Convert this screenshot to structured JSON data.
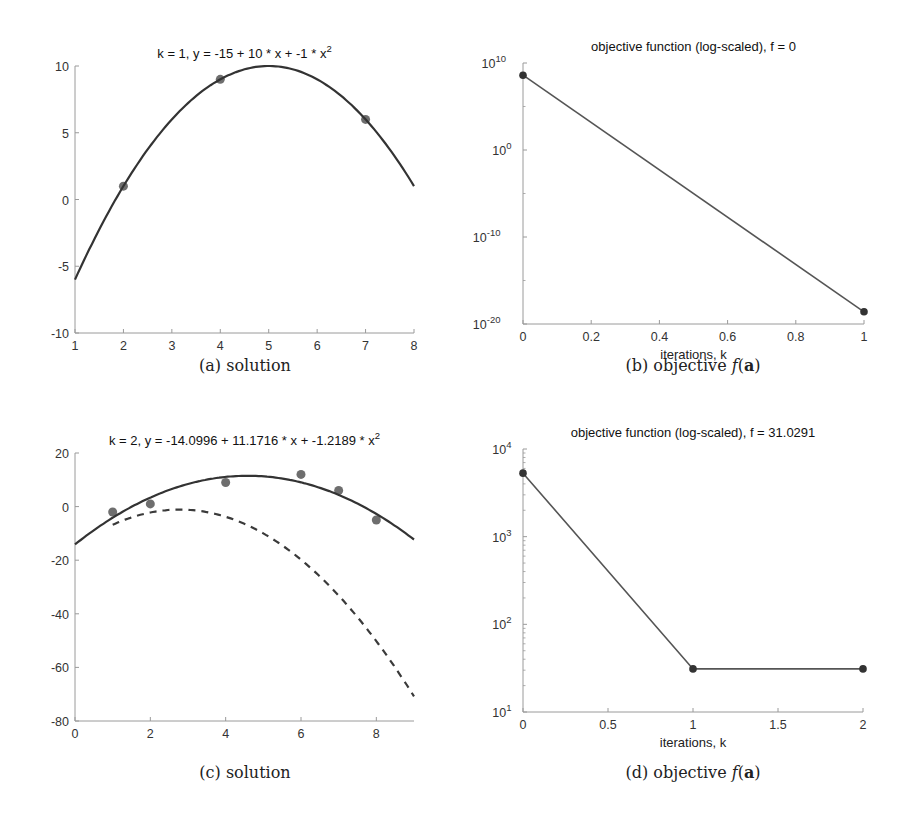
{
  "figure": {
    "captions": [
      {
        "label": "(a) solution"
      },
      {
        "label": "(b) objective",
        "math": "f",
        "arg": "a"
      },
      {
        "label": "(c) solution"
      },
      {
        "label": "(d) objective",
        "math": "f",
        "arg": "a"
      }
    ]
  },
  "chart_data": [
    {
      "id": "a",
      "type": "scatter",
      "title": "k = 1, y = -15 + 10 * x + -1 * x^2",
      "title_main": "k = 1, y = -15 + 10 * x + -1 * x",
      "title_sup": "2",
      "xlabel": "",
      "ylabel": "",
      "xlim": [
        1,
        8
      ],
      "ylim": [
        -10,
        10
      ],
      "xticks": [
        1,
        2,
        3,
        4,
        5,
        6,
        7,
        8
      ],
      "yticks": [
        -10,
        -5,
        0,
        5,
        10
      ],
      "series": [
        {
          "name": "data points",
          "style": "markers",
          "x": [
            2,
            4,
            7
          ],
          "y": [
            1,
            9,
            6
          ]
        },
        {
          "name": "fit",
          "style": "solid",
          "coeffs": [
            -15,
            10,
            -1
          ],
          "x_range": [
            1,
            8
          ]
        }
      ],
      "box": {
        "left": 75,
        "top": 66,
        "right": 414,
        "bottom": 333
      }
    },
    {
      "id": "b",
      "type": "line",
      "title": "objective function (log-scaled), f = 0",
      "xlabel": "iterations, k",
      "ylabel": "",
      "yscale": "log",
      "xlim": [
        0,
        1
      ],
      "ylim_exp": [
        -20,
        10
      ],
      "xticks": [
        0,
        0.2,
        0.4,
        0.6,
        0.8,
        1
      ],
      "xtick_labels": [
        "0",
        "0.2",
        "0.4",
        "0.6",
        "0.8",
        "1"
      ],
      "yticks_exp": [
        -20,
        -10,
        0,
        10
      ],
      "series": [
        {
          "name": "objective",
          "style": "line-markers",
          "x": [
            0,
            1
          ],
          "y_exp": [
            8.6,
            -18.6
          ]
        }
      ],
      "box": {
        "left": 523,
        "top": 63,
        "right": 864,
        "bottom": 324
      }
    },
    {
      "id": "c",
      "type": "scatter",
      "title": "k = 2, y = -14.0996 + 11.1716 * x + -1.2189 * x^2",
      "title_main": "k = 2, y = -14.0996 + 11.1716 * x + -1.2189 * x",
      "title_sup": "2",
      "xlabel": "",
      "ylabel": "",
      "xlim": [
        0,
        9
      ],
      "ylim": [
        -80,
        20
      ],
      "xticks": [
        0,
        2,
        4,
        6,
        8
      ],
      "yticks": [
        -80,
        -60,
        -40,
        -20,
        0,
        20
      ],
      "series": [
        {
          "name": "data points",
          "style": "markers",
          "x": [
            1,
            2,
            4,
            6,
            7,
            8
          ],
          "y": [
            -2,
            1,
            9,
            12,
            6,
            -5
          ]
        },
        {
          "name": "fit",
          "style": "solid",
          "coeffs": [
            -14.0996,
            11.1716,
            -1.2189
          ],
          "x_range": [
            0,
            9
          ]
        },
        {
          "name": "previous fit",
          "style": "dashed",
          "coeffs": [
            -15,
            10,
            -1.8
          ],
          "x_range": [
            1,
            9
          ]
        }
      ],
      "box": {
        "left": 75,
        "top": 453,
        "right": 414,
        "bottom": 721
      }
    },
    {
      "id": "d",
      "type": "line",
      "title": "objective function (log-scaled), f = 31.0291",
      "xlabel": "iterations, k",
      "ylabel": "",
      "yscale": "log",
      "xlim": [
        0,
        2
      ],
      "ylim_exp": [
        1,
        4
      ],
      "xticks": [
        0,
        0.5,
        1,
        1.5,
        2
      ],
      "xtick_labels": [
        "0",
        "0.5",
        "1",
        "1.5",
        "2"
      ],
      "yticks_exp": [
        1,
        2,
        3,
        4
      ],
      "series": [
        {
          "name": "objective",
          "style": "line-markers",
          "x": [
            0,
            1,
            2
          ],
          "y": [
            5300,
            31.0291,
            31.0291
          ]
        }
      ],
      "box": {
        "left": 523,
        "top": 449,
        "right": 863,
        "bottom": 712
      }
    }
  ],
  "colors": {
    "axis": "#9a9a9a",
    "curve": "#333333",
    "marker": "#555555",
    "line": "#555555",
    "marker_dark": "#333333"
  }
}
